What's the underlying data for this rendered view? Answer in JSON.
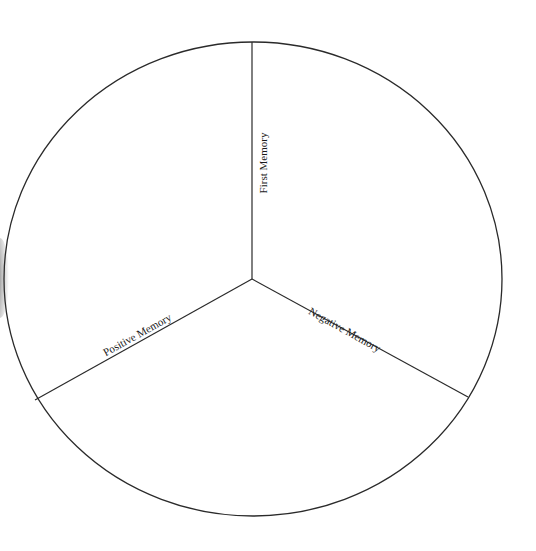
{
  "diagram": {
    "type": "pie-divider",
    "sections": [
      {
        "label": "First Memory"
      },
      {
        "label": "Positive Memory"
      },
      {
        "label": "Negative Memory"
      }
    ],
    "colors": {
      "stroke": "#2a2a2a",
      "text": "#1a1a1a",
      "background": "#ffffff"
    }
  }
}
